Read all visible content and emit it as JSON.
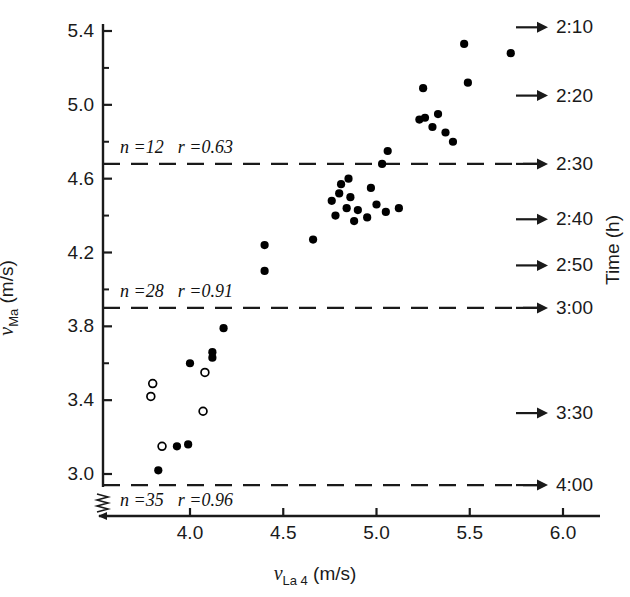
{
  "chart_data": {
    "type": "scatter",
    "title": "",
    "xlabel": "v_La 4 (m/s)",
    "ylabel": "v_Ma (m/s)",
    "right_axis_label": "Time (h)",
    "xlim": [
      3.62,
      6.05
    ],
    "ylim": [
      2.83,
      5.46
    ],
    "grid": false,
    "legend": "none",
    "xticks": [
      4.0,
      4.5,
      5.0,
      5.5,
      6.0
    ],
    "xtick_labels": [
      "4.0",
      "4.5",
      "5.0",
      "5.5",
      "6.0"
    ],
    "yticks": [
      3.0,
      3.4,
      3.8,
      4.2,
      4.6,
      5.0,
      5.4
    ],
    "ytick_labels": [
      "3.0",
      "3.4",
      "3.8",
      "4.2",
      "4.6",
      "5.0",
      "5.4"
    ],
    "y_minor_ticks": [
      3.1,
      3.2,
      3.3,
      3.5,
      3.6,
      3.7,
      3.9,
      4.0,
      4.1,
      4.3,
      4.4,
      4.5,
      4.7,
      4.8,
      4.9,
      5.1,
      5.2,
      5.3
    ],
    "axis_break": true,
    "reference_lines": [
      {
        "y": 4.68,
        "label_n": "n =12",
        "label_r": "r =0.63",
        "time": "2:30",
        "style": "dashed"
      },
      {
        "y": 3.9,
        "label_n": "n =28",
        "label_r": "r =0.91",
        "time": "3:00",
        "style": "dashed"
      },
      {
        "y": 2.94,
        "label_n": "n =35",
        "label_r": "r =0.96",
        "time": "4:00",
        "style": "dashed"
      }
    ],
    "right_axis_ticks": [
      {
        "time": "2:10",
        "y": 5.42
      },
      {
        "time": "2:20",
        "y": 5.05
      },
      {
        "time": "2:30",
        "y": 4.68
      },
      {
        "time": "2:40",
        "y": 4.38
      },
      {
        "time": "2:50",
        "y": 4.13
      },
      {
        "time": "3:00",
        "y": 3.9
      },
      {
        "time": "3:30",
        "y": 3.33
      },
      {
        "time": "4:00",
        "y": 2.94
      }
    ],
    "series": [
      {
        "name": "filled",
        "marker": "filled-circle",
        "color": "#000000",
        "points": [
          [
            3.83,
            3.02
          ],
          [
            3.93,
            3.15
          ],
          [
            3.99,
            3.16
          ],
          [
            4.0,
            3.6
          ],
          [
            4.12,
            3.66
          ],
          [
            4.12,
            3.63
          ],
          [
            4.18,
            3.79
          ],
          [
            4.4,
            4.1
          ],
          [
            4.4,
            4.24
          ],
          [
            4.66,
            4.27
          ],
          [
            4.76,
            4.48
          ],
          [
            4.78,
            4.4
          ],
          [
            4.8,
            4.52
          ],
          [
            4.81,
            4.57
          ],
          [
            4.84,
            4.44
          ],
          [
            4.85,
            4.6
          ],
          [
            4.86,
            4.5
          ],
          [
            4.88,
            4.37
          ],
          [
            4.9,
            4.43
          ],
          [
            4.95,
            4.39
          ],
          [
            4.97,
            4.55
          ],
          [
            5.0,
            4.46
          ],
          [
            5.03,
            4.68
          ],
          [
            5.05,
            4.42
          ],
          [
            5.06,
            4.75
          ],
          [
            5.12,
            4.44
          ],
          [
            5.23,
            4.92
          ],
          [
            5.25,
            5.09
          ],
          [
            5.26,
            4.93
          ],
          [
            5.3,
            4.88
          ],
          [
            5.33,
            4.95
          ],
          [
            5.37,
            4.85
          ],
          [
            5.41,
            4.8
          ],
          [
            5.47,
            5.33
          ],
          [
            5.49,
            5.12
          ],
          [
            5.72,
            5.28
          ]
        ]
      },
      {
        "name": "open",
        "marker": "open-circle",
        "color": "#000000",
        "points": [
          [
            3.8,
            3.49
          ],
          [
            3.79,
            3.42
          ],
          [
            3.85,
            3.15
          ],
          [
            4.07,
            3.34
          ],
          [
            4.08,
            3.55
          ]
        ]
      }
    ]
  },
  "annotations": {
    "group_top": {
      "n": "n =12",
      "r": "r =0.63"
    },
    "group_mid": {
      "n": "n =28",
      "r": "r =0.91"
    },
    "group_bottom": {
      "n": "n =35",
      "r": "r =0.96"
    }
  },
  "axis_titles": {
    "y": {
      "symbol": "v",
      "subscript": "Ma",
      "units": "(m/s)"
    },
    "x": {
      "symbol": "v",
      "subscript": "La 4",
      "units": "(m/s)"
    },
    "right": "Time (h)"
  }
}
